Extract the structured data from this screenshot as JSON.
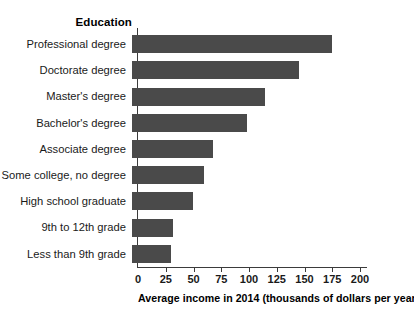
{
  "chart_data": {
    "type": "bar",
    "orientation": "horizontal",
    "title": "",
    "category_axis_title": "Education",
    "xlabel": "Average income in 2014 (thousands of dollars per year)",
    "ylabel": "Education",
    "xlim": [
      0,
      200
    ],
    "xticks": [
      0,
      25,
      50,
      75,
      100,
      125,
      150,
      175,
      200
    ],
    "xtick_labels": [
      "0",
      "25",
      "50",
      "75",
      "100",
      "125",
      "150",
      "175",
      "200"
    ],
    "grid": false,
    "legend": null,
    "bar_color": "#4a4a4a",
    "background_color": "#ffffff",
    "categories": [
      "Professional degree",
      "Doctorate degree",
      "Master's degree",
      "Bachelor's degree",
      "Associate degree",
      "Some college, no degree",
      "High school graduate",
      "9th to 12th grade",
      "Less than 9th grade"
    ],
    "values": [
      180,
      150,
      120,
      104,
      73,
      65,
      55,
      37,
      35
    ],
    "bars": [
      {
        "label": "Professional degree",
        "value": 180
      },
      {
        "label": "Doctorate degree",
        "value": 150
      },
      {
        "label": "Master's degree",
        "value": 120
      },
      {
        "label": "Bachelor's degree",
        "value": 104
      },
      {
        "label": "Associate degree",
        "value": 73
      },
      {
        "label": "Some college, no degree",
        "value": 65
      },
      {
        "label": "High school graduate",
        "value": 55
      },
      {
        "label": "9th to 12th grade",
        "value": 37
      },
      {
        "label": "Less than 9th grade",
        "value": 35
      }
    ]
  }
}
